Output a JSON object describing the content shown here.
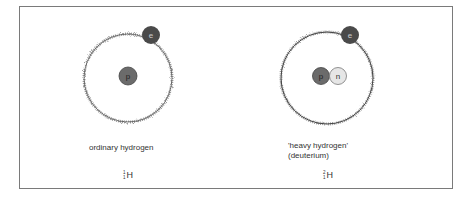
{
  "diagram": {
    "colors": {
      "frame": "#7a7a7a",
      "orbit": "#555555",
      "electron": "#4a4a4a",
      "proton": "#6b6b6b",
      "neutron": "#e6e6e6",
      "text": "#333333"
    },
    "atoms": [
      {
        "id": "ordinary-hydrogen",
        "label_lines": [
          "ordinary hydrogen"
        ],
        "symbol": "H",
        "mass_number": "1",
        "atomic_number": "1",
        "electron_label": "e",
        "nucleus": [
          {
            "type": "proton",
            "label": "p"
          }
        ]
      },
      {
        "id": "deuterium",
        "label_lines": [
          "'heavy hydrogen'",
          "(deuterium)"
        ],
        "symbol": "H",
        "mass_number": "2",
        "atomic_number": "1",
        "electron_label": "e",
        "nucleus": [
          {
            "type": "proton",
            "label": "p"
          },
          {
            "type": "neutron",
            "label": "n"
          }
        ]
      }
    ]
  }
}
